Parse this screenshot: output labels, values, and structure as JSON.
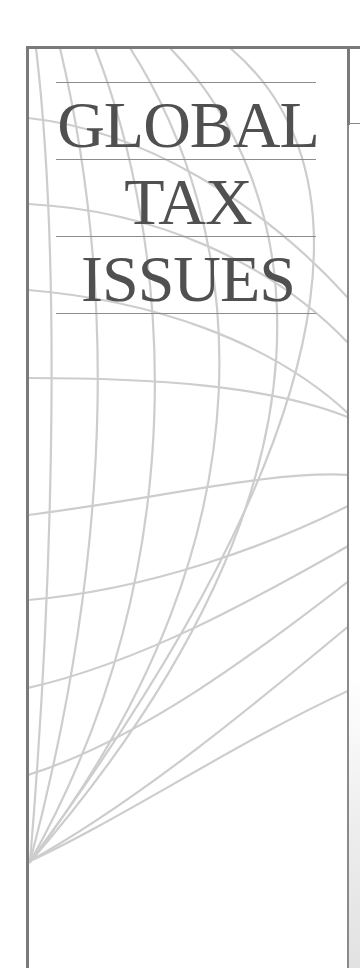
{
  "cover": {
    "title_lines": [
      "GLOBAL",
      "TAX",
      "ISSUES"
    ],
    "graphic": "globe-grid-icon",
    "colors": {
      "border": "#7a7a7a",
      "text": "#505050",
      "grid": "#cfcfcf",
      "rule": "#8c8c8c",
      "background": "#ffffff"
    }
  }
}
